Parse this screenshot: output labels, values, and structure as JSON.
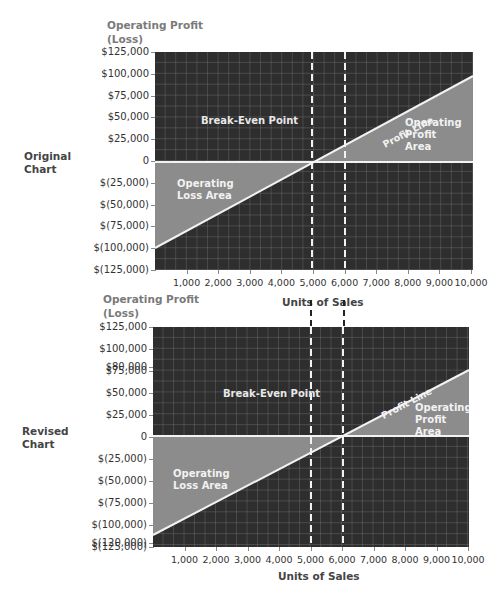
{
  "charts": [
    {
      "side_label": "Original\nChart",
      "y_title": "Operating Profit\n(Loss)",
      "x_title": "Units of Sales",
      "y_ticks": [
        "$125,000",
        "$100,000",
        "$75,000",
        "$50,000",
        "$25,000",
        "0",
        "$(25,000)",
        "$(50,000)",
        "$(75,000)",
        "$(100,000)",
        "$(125,000)"
      ],
      "x_ticks": [
        "1,000",
        "2,000",
        "3,000",
        "4,000",
        "5,000",
        "6,000",
        "7,000",
        "8,000",
        "9,000",
        "10,000"
      ],
      "labels": {
        "break_even": "Break-Even Point",
        "profit_line": "Profit Line",
        "profit_area": "Operating\nProfit\nArea",
        "loss_area": "Operating\nLoss Area"
      }
    },
    {
      "side_label": "Revised\nChart",
      "y_title": "Operating Profit\n(Loss)",
      "x_title": "Units of Sales",
      "y_ticks": [
        "$125,000",
        "$100,000",
        "$80,000",
        "$75,000",
        "$50,000",
        "$25,000",
        "0",
        "$(25,000)",
        "$(50,000)",
        "$(75,000)",
        "$(100,000)",
        "$(120,000)",
        "$(125,000)"
      ],
      "x_ticks": [
        "1,000",
        "2,000",
        "3,000",
        "4,000",
        "5,000",
        "6,000",
        "7,000",
        "8,000",
        "9,000",
        "10,000"
      ],
      "labels": {
        "break_even": "Break-Even Point",
        "profit_line": "Profit Line",
        "profit_area": "Operating\nProfit\nArea",
        "loss_area": "Operating\nLoss Area"
      }
    }
  ],
  "chart_data": [
    {
      "type": "line",
      "title": "Original Chart",
      "xlabel": "Units of Sales",
      "ylabel": "Operating Profit (Loss)",
      "x": [
        0,
        10000
      ],
      "series": [
        {
          "name": "Profit Line",
          "values": [
            -100000,
            100000
          ]
        }
      ],
      "break_even_units": 5000,
      "reference_lines_x": [
        5000,
        6000
      ],
      "xlim": [
        0,
        10000
      ],
      "ylim": [
        -125000,
        125000
      ],
      "grid": true
    },
    {
      "type": "line",
      "title": "Revised Chart",
      "xlabel": "Units of Sales",
      "ylabel": "Operating Profit (Loss)",
      "x": [
        0,
        10000
      ],
      "series": [
        {
          "name": "Profit Line",
          "values": [
            -120000,
            80000
          ]
        }
      ],
      "break_even_units": 6000,
      "reference_lines_x": [
        5000,
        6000
      ],
      "xlim": [
        0,
        10000
      ],
      "ylim": [
        -125000,
        125000
      ],
      "grid": true
    }
  ],
  "colors": {
    "plot_bg": "#2e2e2e",
    "grid": "#6a6a6a",
    "area": "#8c8c8c",
    "line": "#f2f2f2",
    "text_muted": "#7a7a7a"
  }
}
